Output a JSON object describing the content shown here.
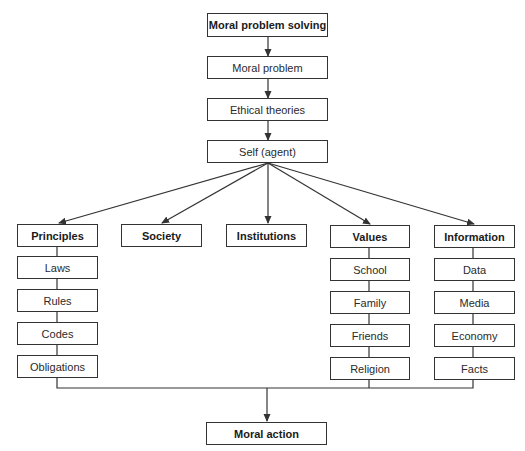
{
  "diagram": {
    "title": "Moral problem solving",
    "colors": {
      "line": "#333333",
      "box_border": "#333333",
      "text": "#2a2a2a",
      "background": "#ffffff"
    },
    "nodes": [
      {
        "id": "moral_problem_solving",
        "label": "Moral problem solving",
        "bold": true,
        "x": 207,
        "y": 13,
        "w": 121,
        "h": 24
      },
      {
        "id": "moral_problem",
        "label": "Moral problem",
        "bold": false,
        "x": 207,
        "y": 56,
        "w": 121,
        "h": 23
      },
      {
        "id": "ethical_theories",
        "label": "Ethical theories",
        "bold": false,
        "x": 207,
        "y": 98,
        "w": 121,
        "h": 23
      },
      {
        "id": "self_agent",
        "label": "Self (agent)",
        "bold": false,
        "x": 207,
        "y": 140,
        "w": 121,
        "h": 23
      },
      {
        "id": "principles",
        "label": "Principles",
        "bold": true,
        "x": 17,
        "y": 224,
        "w": 81,
        "h": 23
      },
      {
        "id": "society",
        "label": "Society",
        "bold": true,
        "x": 121,
        "y": 224,
        "w": 81,
        "h": 23
      },
      {
        "id": "institutions",
        "label": "Institutions",
        "bold": true,
        "x": 226,
        "y": 224,
        "w": 81,
        "h": 23
      },
      {
        "id": "values",
        "label": "Values",
        "bold": true,
        "x": 330,
        "y": 225,
        "w": 80,
        "h": 23
      },
      {
        "id": "information",
        "label": "Information",
        "bold": true,
        "x": 434,
        "y": 225,
        "w": 81,
        "h": 23
      },
      {
        "id": "laws",
        "label": "Laws",
        "bold": false,
        "x": 17,
        "y": 256,
        "w": 81,
        "h": 23
      },
      {
        "id": "rules",
        "label": "Rules",
        "bold": false,
        "x": 17,
        "y": 289,
        "w": 81,
        "h": 23
      },
      {
        "id": "codes",
        "label": "Codes",
        "bold": false,
        "x": 17,
        "y": 322,
        "w": 81,
        "h": 23
      },
      {
        "id": "obligations",
        "label": "Obligations",
        "bold": false,
        "x": 17,
        "y": 355,
        "w": 81,
        "h": 23
      },
      {
        "id": "school",
        "label": "School",
        "bold": false,
        "x": 330,
        "y": 258,
        "w": 80,
        "h": 23
      },
      {
        "id": "family",
        "label": "Family",
        "bold": false,
        "x": 330,
        "y": 291,
        "w": 80,
        "h": 23
      },
      {
        "id": "friends",
        "label": "Friends",
        "bold": false,
        "x": 330,
        "y": 324,
        "w": 80,
        "h": 23
      },
      {
        "id": "religion",
        "label": "Religion",
        "bold": false,
        "x": 330,
        "y": 357,
        "w": 80,
        "h": 23
      },
      {
        "id": "data",
        "label": "Data",
        "bold": false,
        "x": 434,
        "y": 258,
        "w": 81,
        "h": 23
      },
      {
        "id": "media",
        "label": "Media",
        "bold": false,
        "x": 434,
        "y": 291,
        "w": 81,
        "h": 23
      },
      {
        "id": "economy",
        "label": "Economy",
        "bold": false,
        "x": 434,
        "y": 324,
        "w": 81,
        "h": 23
      },
      {
        "id": "facts",
        "label": "Facts",
        "bold": false,
        "x": 434,
        "y": 357,
        "w": 81,
        "h": 23
      },
      {
        "id": "moral_action",
        "label": "Moral action",
        "bold": true,
        "x": 206,
        "y": 422,
        "w": 121,
        "h": 23
      }
    ],
    "arrows": [
      {
        "from": "moral_problem_solving",
        "to": "moral_problem",
        "points": [
          [
            268,
            37
          ],
          [
            268,
            56
          ]
        ]
      },
      {
        "from": "moral_problem",
        "to": "ethical_theories",
        "points": [
          [
            268,
            79
          ],
          [
            268,
            98
          ]
        ]
      },
      {
        "from": "ethical_theories",
        "to": "self_agent",
        "points": [
          [
            268,
            121
          ],
          [
            268,
            140
          ]
        ]
      },
      {
        "from": "self_agent",
        "to": "principles",
        "points": [
          [
            268,
            163
          ],
          [
            59,
            223
          ]
        ]
      },
      {
        "from": "self_agent",
        "to": "society",
        "points": [
          [
            268,
            163
          ],
          [
            162,
            223
          ]
        ]
      },
      {
        "from": "self_agent",
        "to": "institutions",
        "points": [
          [
            268,
            163
          ],
          [
            268,
            223
          ]
        ]
      },
      {
        "from": "self_agent",
        "to": "values",
        "points": [
          [
            268,
            163
          ],
          [
            370,
            224
          ]
        ]
      },
      {
        "from": "self_agent",
        "to": "information",
        "points": [
          [
            268,
            163
          ],
          [
            474,
            224
          ]
        ]
      },
      {
        "from": "merge",
        "to": "moral_action",
        "points": [
          [
            267,
            388
          ],
          [
            267,
            421
          ]
        ]
      }
    ],
    "lines": [
      {
        "name": "principles-chain",
        "points": [
          [
            57,
            247
          ],
          [
            57,
            355
          ]
        ]
      },
      {
        "name": "values-chain",
        "points": [
          [
            369,
            248
          ],
          [
            369,
            357
          ]
        ]
      },
      {
        "name": "information-chain",
        "points": [
          [
            473,
            248
          ],
          [
            473,
            357
          ]
        ]
      },
      {
        "name": "merge-left",
        "points": [
          [
            57,
            378
          ],
          [
            57,
            388
          ],
          [
            473,
            388
          ],
          [
            473,
            380
          ]
        ]
      },
      {
        "name": "merge-values",
        "points": [
          [
            369,
            380
          ],
          [
            369,
            388
          ]
        ]
      }
    ]
  }
}
